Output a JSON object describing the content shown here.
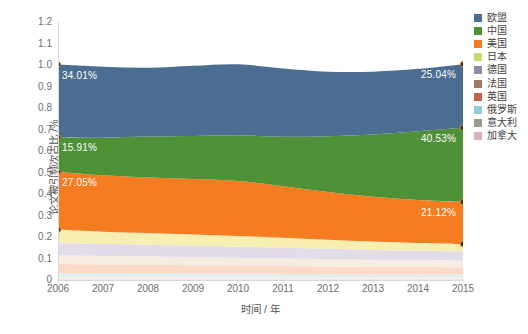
{
  "chart_data": {
    "type": "area",
    "title": "",
    "xlabel": "时间 / 年",
    "ylabel": "论文被引频次占比 /%",
    "stacked": true,
    "grid": false,
    "legend_position": "right",
    "categories": [
      "2006",
      "2007",
      "2008",
      "2009",
      "2010",
      "2011",
      "2012",
      "2013",
      "2014",
      "2015"
    ],
    "x": [
      2006,
      2007,
      2008,
      2009,
      2010,
      2011,
      2012,
      2013,
      2014,
      2015
    ],
    "xlim": [
      2006,
      2015
    ],
    "ylim": [
      0,
      1.2
    ],
    "yticks": [
      "0",
      "0.1",
      "0.2",
      "0.3",
      "0.4",
      "0.5",
      "0.6",
      "0.7",
      "0.8",
      "0.9",
      "1.0",
      "1.1",
      "1.2"
    ],
    "ytick_values": [
      0,
      0.1,
      0.2,
      0.3,
      0.4,
      0.5,
      0.6,
      0.7,
      0.8,
      0.9,
      1.0,
      1.1,
      1.2
    ],
    "series": [
      {
        "name": "欧盟",
        "color": "#4b6d92",
        "values": [
          0.338,
          0.33,
          0.32,
          0.326,
          0.33,
          0.318,
          0.3,
          0.292,
          0.29,
          0.296
        ]
      },
      {
        "name": "中国",
        "color": "#4f9137",
        "values": [
          0.16,
          0.175,
          0.19,
          0.2,
          0.212,
          0.23,
          0.26,
          0.29,
          0.32,
          0.345
        ]
      },
      {
        "name": "美国",
        "color": "#f57c20",
        "values": [
          0.27,
          0.262,
          0.258,
          0.258,
          0.256,
          0.24,
          0.222,
          0.208,
          0.2,
          0.196
        ]
      },
      {
        "name": "日本",
        "color": "#f7efb2",
        "values": [
          0.062,
          0.058,
          0.055,
          0.052,
          0.05,
          0.046,
          0.042,
          0.039,
          0.036,
          0.034
        ]
      },
      {
        "name": "德国",
        "color": "#e2dce8",
        "values": [
          0.058,
          0.056,
          0.055,
          0.054,
          0.052,
          0.05,
          0.048,
          0.046,
          0.044,
          0.043
        ]
      },
      {
        "name": "法国",
        "color": "#f6ece2",
        "values": [
          0.04,
          0.039,
          0.038,
          0.037,
          0.036,
          0.035,
          0.034,
          0.033,
          0.032,
          0.031
        ]
      },
      {
        "name": "英国",
        "color": "#fadbc8",
        "values": [
          0.042,
          0.041,
          0.04,
          0.039,
          0.038,
          0.037,
          0.036,
          0.035,
          0.034,
          0.033
        ]
      },
      {
        "name": "俄罗斯",
        "color": "#dff0ec",
        "values": [
          0.016,
          0.015,
          0.015,
          0.014,
          0.014,
          0.013,
          0.013,
          0.012,
          0.012,
          0.012
        ]
      },
      {
        "name": "意大利",
        "color": "#f0f0e8",
        "values": [
          0.009,
          0.009,
          0.009,
          0.009,
          0.008,
          0.008,
          0.008,
          0.008,
          0.008,
          0.008
        ]
      },
      {
        "name": "加拿大",
        "color": "#f6e6ee",
        "values": [
          0.007,
          0.007,
          0.007,
          0.007,
          0.007,
          0.007,
          0.006,
          0.006,
          0.006,
          0.006
        ]
      }
    ],
    "annotations": [
      {
        "text": "34.01%",
        "series": "欧盟",
        "x": 2006,
        "anchor": "start"
      },
      {
        "text": "25.04%",
        "series": "欧盟",
        "x": 2015,
        "anchor": "end"
      },
      {
        "text": "15.91%",
        "series": "中国",
        "x": 2006,
        "anchor": "start"
      },
      {
        "text": "40.53%",
        "series": "中国",
        "x": 2015,
        "anchor": "end"
      },
      {
        "text": "27.05%",
        "series": "美国",
        "x": 2006,
        "anchor": "start"
      },
      {
        "text": "21.12%",
        "series": "美国",
        "x": 2015,
        "anchor": "end"
      }
    ],
    "markers": {
      "color": "#2b2b2b",
      "edge": "#c8821e",
      "at_x": [
        2006,
        2015
      ],
      "boundaries": [
        "欧盟-top",
        "中国-top",
        "美国-top",
        "日本-top"
      ]
    }
  },
  "legend": {
    "items": [
      {
        "label": "欧盟",
        "color": "#4b6d92"
      },
      {
        "label": "中国",
        "color": "#4f9137"
      },
      {
        "label": "美国",
        "color": "#f57c20"
      },
      {
        "label": "日本",
        "color": "#cfd86a"
      },
      {
        "label": "德国",
        "color": "#8f8aa8"
      },
      {
        "label": "法国",
        "color": "#9b7b63"
      },
      {
        "label": "英国",
        "color": "#c9604c"
      },
      {
        "label": "俄罗斯",
        "color": "#93cbd4"
      },
      {
        "label": "意大利",
        "color": "#9a9b8a"
      },
      {
        "label": "加拿大",
        "color": "#dbaec4"
      }
    ]
  },
  "axes": {
    "y_title": "论文被引频次占比 /%",
    "x_title": "时间 / 年"
  }
}
